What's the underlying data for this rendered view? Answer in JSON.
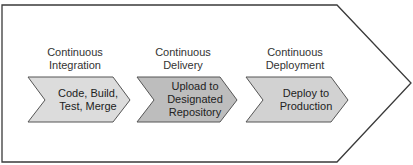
{
  "diagram": {
    "colors": {
      "outline": "#3a3a3a",
      "stage_fill_light": "#dcdcdc",
      "stage_fill_dark": "#bdbdbd",
      "background": "#ffffff"
    },
    "stages": [
      {
        "title": "Continuous Integration",
        "title_line1": "Continuous",
        "title_line2": "Integration",
        "content_line1": "Code, Build,",
        "content_line2": "Test, Merge",
        "content_line3": ""
      },
      {
        "title": "Continuous Delivery",
        "title_line1": "Continuous",
        "title_line2": "Delivery",
        "content_line1": "Upload to",
        "content_line2": "Designated",
        "content_line3": "Repository"
      },
      {
        "title": "Continuous Deployment",
        "title_line1": "Continuous",
        "title_line2": "Deployment",
        "content_line1": "Deploy to",
        "content_line2": "Production",
        "content_line3": ""
      }
    ]
  }
}
